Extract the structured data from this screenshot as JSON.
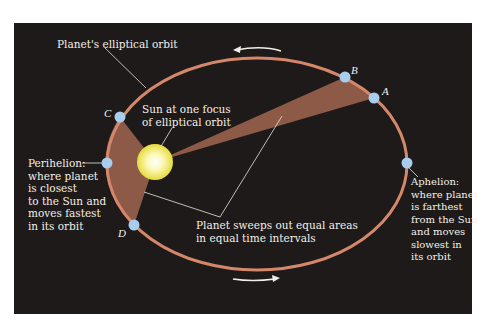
{
  "diagram": {
    "colors": {
      "background": "#1d1a19",
      "orbit": "#d4876a",
      "swept_area": "#8c5a46",
      "point": "#a9cdef",
      "sun_core": "#fffbe6",
      "sun_edge": "#e9e34a",
      "text": "#f3efe8"
    },
    "labels": {
      "orbit": "Planet's elliptical orbit",
      "sun": "Sun at one focus\nof elliptical orbit",
      "perihelion": "Perihelion:\nwhere planet\nis closest\nto the Sun and\nmoves fastest\nin its orbit",
      "aphelion": "Aphelion:\nwhere planet\nis farthest\nfrom the Sun\nand moves\nslowest in\nits orbit",
      "equal_areas": "Planet sweeps out equal areas\nin equal time intervals"
    },
    "points": [
      {
        "id": "A",
        "label": "A"
      },
      {
        "id": "B",
        "label": "B"
      },
      {
        "id": "C",
        "label": "C"
      },
      {
        "id": "D",
        "label": "D"
      }
    ],
    "direction": "counterclockwise"
  }
}
